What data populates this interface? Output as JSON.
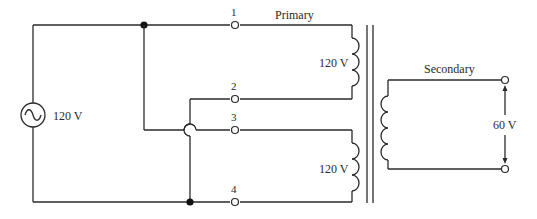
{
  "diagram": {
    "source": {
      "label": "120 V",
      "symbol": "ac-source"
    },
    "terminals": [
      {
        "id": "1",
        "label": "1"
      },
      {
        "id": "2",
        "label": "2"
      },
      {
        "id": "3",
        "label": "3"
      },
      {
        "id": "4",
        "label": "4"
      }
    ],
    "primary": {
      "title": "Primary",
      "winding_upper_label": "120 V",
      "winding_lower_label": "120 V"
    },
    "secondary": {
      "title": "Secondary",
      "output_label": "60 V"
    }
  }
}
